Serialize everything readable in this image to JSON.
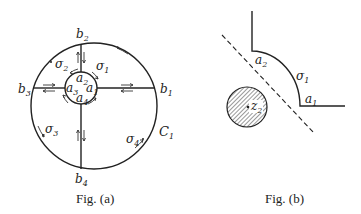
{
  "figure_a": {
    "caption": "Fig. (a)",
    "outer_circle_label": "C",
    "outer_circle_label_sub": "1",
    "points_b": [
      {
        "base": "b",
        "sub": "1"
      },
      {
        "base": "b",
        "sub": "2"
      },
      {
        "base": "b",
        "sub": "3"
      },
      {
        "base": "b",
        "sub": "4"
      }
    ],
    "points_a": [
      {
        "base": "a",
        "sub": "1"
      },
      {
        "base": "a",
        "sub": "2"
      },
      {
        "base": "a",
        "sub": "3"
      },
      {
        "base": "a",
        "sub": "4"
      }
    ],
    "regions": [
      {
        "base": "σ",
        "sub": "1"
      },
      {
        "base": "σ",
        "sub": "2"
      },
      {
        "base": "σ",
        "sub": "3"
      },
      {
        "base": "σ",
        "sub": "4"
      }
    ]
  },
  "figure_b": {
    "caption": "Fig. (b)",
    "labels": {
      "a2": {
        "base": "a",
        "sub": "2"
      },
      "a1": {
        "base": "a",
        "sub": "1"
      },
      "sigma1": {
        "base": "σ",
        "sub": "1"
      },
      "z2": {
        "base": "z",
        "sub": "2"
      }
    }
  },
  "colors": {
    "ink": "#222222",
    "background": "#ffffff"
  }
}
